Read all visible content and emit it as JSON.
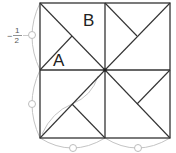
{
  "diagram": {
    "title": "",
    "square": {
      "x": 40,
      "y": 3,
      "w": 130,
      "h": 135
    },
    "center": {
      "x": 105,
      "y": 70
    },
    "colors": {
      "line": "#333333",
      "construction": "#bbbbbb",
      "background": "#ffffff"
    },
    "labels": {
      "a": "A",
      "b": "B",
      "fraction_sign": "−",
      "fraction_numerator": "1",
      "fraction_denominator": "2"
    },
    "segments": [
      {
        "name": "top-left-diagonal",
        "x1": 40,
        "y1": 3,
        "x2": 105,
        "y2": 70
      },
      {
        "name": "top-left-inner",
        "x1": 40,
        "y1": 70,
        "x2": 72,
        "y2": 36
      },
      {
        "name": "top-right-diagonal",
        "x1": 105,
        "y1": 70,
        "x2": 170,
        "y2": 3
      },
      {
        "name": "top-right-inner",
        "x1": 105,
        "y1": 3,
        "x2": 137,
        "y2": 36
      },
      {
        "name": "bottom-left-diagonal",
        "x1": 40,
        "y1": 138,
        "x2": 105,
        "y2": 70
      },
      {
        "name": "bottom-left-inner",
        "x1": 72,
        "y1": 104,
        "x2": 105,
        "y2": 138
      },
      {
        "name": "bottom-right-diagonal",
        "x1": 105,
        "y1": 70,
        "x2": 170,
        "y2": 138
      },
      {
        "name": "bottom-right-inner",
        "x1": 170,
        "y1": 70,
        "x2": 137,
        "y2": 104
      }
    ],
    "construction_markers": [
      {
        "name": "left-upper-marker",
        "cx": 32,
        "cy": 35
      },
      {
        "name": "left-lower-marker",
        "cx": 32,
        "cy": 104
      },
      {
        "name": "bottom-left-marker",
        "cx": 73,
        "cy": 148
      },
      {
        "name": "bottom-right-marker",
        "cx": 138,
        "cy": 148
      }
    ]
  }
}
